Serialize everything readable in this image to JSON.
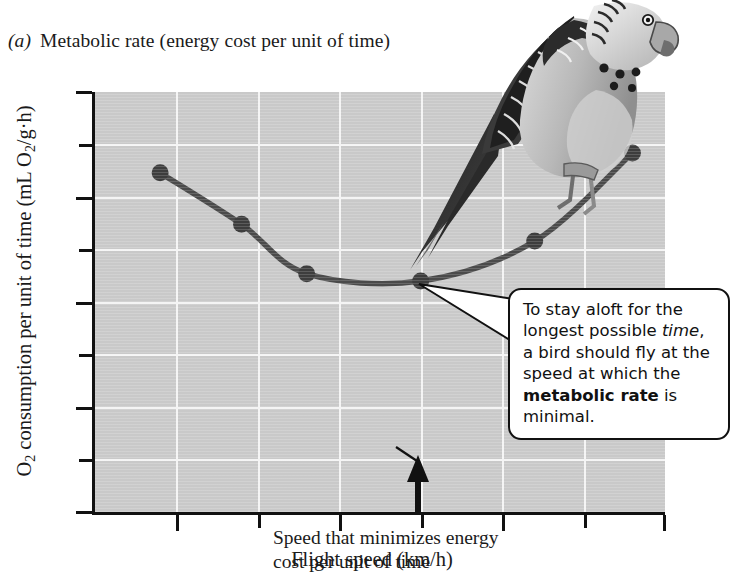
{
  "caption": {
    "part_label": "(a)",
    "text": "Metabolic rate (energy cost per unit of time)"
  },
  "axes": {
    "x_title": "Flight speed (km/h)",
    "y_title_pre": "O",
    "y_title_sub1": "2",
    "y_title_mid": " consumption per unit of time (mL O",
    "y_title_sub2": "2",
    "y_title_post": "/g·h)",
    "y_ticks": [
      "0",
      "10",
      "20",
      "30",
      "40"
    ],
    "x_ticks": [
      "20",
      "30",
      "40",
      "50"
    ]
  },
  "annotations": {
    "speed_note_line1": "Speed that minimizes energy",
    "speed_note_line2": "cost per unit of time",
    "callout_line1": "To stay aloft for the",
    "callout_line2_pre": "longest possible ",
    "callout_line2_em": "time",
    "callout_line2_post": ",",
    "callout_line3": "a bird should fly at the",
    "callout_line4": "speed at which the",
    "callout_line5_strong": "metabolic rate",
    "callout_line5_post": " is",
    "callout_line6": "minimal."
  },
  "illustration": {
    "name": "budgerigar-bird-illustration"
  },
  "colors": {
    "plot_background": "#c9c9c9",
    "gridline": "#f4f4f4",
    "axis": "#111111",
    "curve": "#4a4a4a",
    "marker": "#3d3d3d",
    "callout_background": "#ffffff"
  },
  "chart_data": {
    "type": "line",
    "title": "Metabolic rate (energy cost per unit of time)",
    "xlabel": "Flight speed (km/h)",
    "ylabel": "O2 consumption per unit of time (mL O2/g·h)",
    "xlim": [
      15,
      50
    ],
    "ylim": [
      0,
      40
    ],
    "x_major_ticks": [
      20,
      30,
      40,
      50
    ],
    "x_minor_ticks": [
      25,
      35,
      45
    ],
    "y_major_ticks": [
      0,
      10,
      20,
      30,
      40
    ],
    "y_minor_ticks": [
      5,
      15,
      25,
      35
    ],
    "grid": true,
    "legend": false,
    "series": [
      {
        "name": "Metabolic rate",
        "x": [
          19,
          24,
          28,
          35,
          42,
          48
        ],
        "values": [
          32.3,
          27.4,
          22.7,
          22.0,
          25.8,
          34.2
        ]
      }
    ],
    "markers": [
      {
        "x": 19,
        "y": 32.3
      },
      {
        "x": 24,
        "y": 27.4
      },
      {
        "x": 28,
        "y": 22.7
      },
      {
        "x": 35,
        "y": 22.0
      },
      {
        "x": 42,
        "y": 25.8
      },
      {
        "x": 48,
        "y": 34.2
      }
    ],
    "annotations": [
      {
        "type": "arrow",
        "x": 35,
        "y": 0,
        "text": "Speed that minimizes energy cost per unit of time"
      },
      {
        "type": "callout",
        "x": 35,
        "y": 22.0,
        "text": "To stay aloft for the longest possible time, a bird should fly at the speed at which the metabolic rate is minimal."
      }
    ]
  }
}
